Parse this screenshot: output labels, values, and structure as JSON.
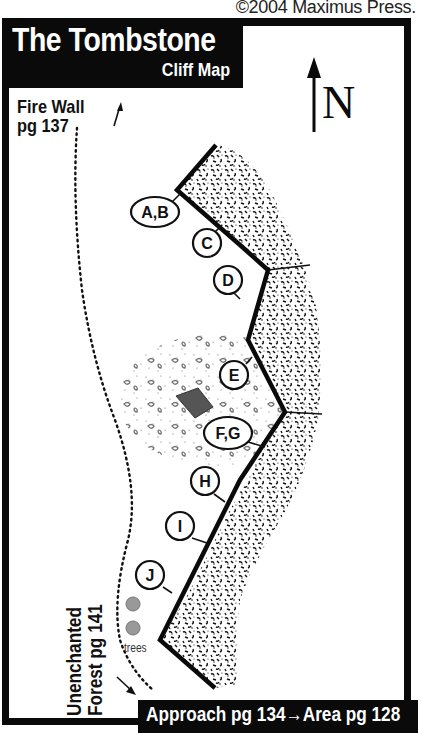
{
  "copyright": "©2004 Maximus Press.",
  "title": {
    "main": "The Tombstone",
    "sub": "Cliff Map"
  },
  "compass": {
    "label": "N"
  },
  "labels": {
    "fire_wall": [
      "Fire Wall",
      "pg 137"
    ],
    "unenchanted_forest": [
      "Unenchanted",
      "Forest pg 141"
    ],
    "trees": "trees",
    "footer": "Approach pg 134→Area pg 128"
  },
  "markers": [
    {
      "id": "A,B",
      "cx": 155,
      "cy": 212
    },
    {
      "id": "C",
      "cx": 207,
      "cy": 243
    },
    {
      "id": "D",
      "cx": 228,
      "cy": 280
    },
    {
      "id": "E",
      "cx": 234,
      "cy": 375
    },
    {
      "id": "F,G",
      "cx": 228,
      "cy": 433
    },
    {
      "id": "H",
      "cx": 205,
      "cy": 481
    },
    {
      "id": "I",
      "cx": 180,
      "cy": 526
    },
    {
      "id": "J",
      "cx": 150,
      "cy": 575
    }
  ],
  "colors": {
    "ink": "#0a0a0a",
    "boulder_marker": "#555555",
    "tree": "#999999"
  }
}
